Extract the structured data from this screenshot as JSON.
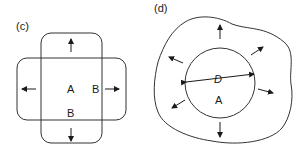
{
  "panels": [
    {
      "id": "c",
      "label": "(c)",
      "regions": {
        "inner": "A",
        "outer_right": "B",
        "outer_bottom": "B"
      },
      "description": "Two overlapping rounded rectangles (vertical and horizontal) with outward arrows"
    },
    {
      "id": "d",
      "label": "(d)",
      "regions": {
        "inner": "A",
        "diameter": "D"
      },
      "description": "Circle of diameter D inside an irregular boundary with radial outward arrows"
    }
  ],
  "colors": {
    "stroke": "#333333",
    "text": "#1a1a1a",
    "background": "#ffffff"
  }
}
